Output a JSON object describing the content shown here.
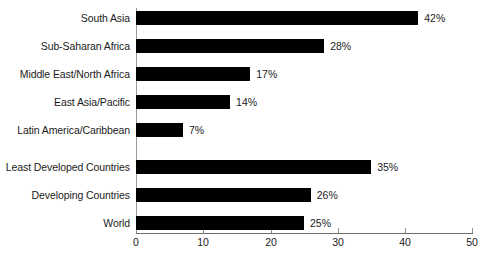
{
  "chart_data": {
    "type": "bar",
    "orientation": "horizontal",
    "title": "",
    "xlabel": "",
    "ylabel": "",
    "xlim": [
      0,
      50
    ],
    "xticks": [
      0,
      10,
      20,
      30,
      40,
      50
    ],
    "xtick_labels": [
      "0",
      "10",
      "20",
      "30",
      "40",
      "50"
    ],
    "grid": false,
    "legend": false,
    "bar_color": "#000000",
    "axis_color": "#8d8d8d",
    "value_suffix": "%",
    "groups": [
      {
        "name": "regions",
        "categories": [
          "South Asia",
          "Sub-Saharan Africa",
          "Middle East/North Africa",
          "East Asia/Pacific",
          "Latin America/Caribbean"
        ],
        "values": [
          42,
          28,
          17,
          14,
          7
        ],
        "value_labels": [
          "42%",
          "28%",
          "17%",
          "14%",
          "7%"
        ]
      },
      {
        "name": "aggregates",
        "categories": [
          "Least Developed Countries",
          "Developing Countries",
          "World"
        ],
        "values": [
          35,
          26,
          25
        ],
        "value_labels": [
          "35%",
          "26%",
          "25%"
        ]
      }
    ],
    "categories": [
      "South Asia",
      "Sub-Saharan Africa",
      "Middle East/North Africa",
      "East Asia/Pacific",
      "Latin America/Caribbean",
      "Least Developed Countries",
      "Developing Countries",
      "World"
    ],
    "values": [
      42,
      28,
      17,
      14,
      7,
      35,
      26,
      25
    ],
    "value_labels": [
      "42%",
      "28%",
      "17%",
      "14%",
      "7%",
      "35%",
      "26%",
      "25%"
    ]
  }
}
